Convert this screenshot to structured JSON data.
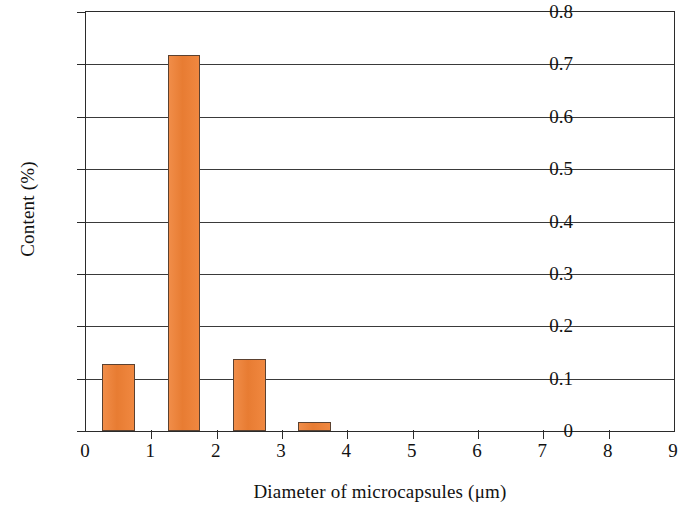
{
  "chart_data": {
    "type": "bar",
    "title": "",
    "xlabel": "Diameter of microcapsules (μm)",
    "ylabel": "Content (%)",
    "xlim": [
      0,
      9
    ],
    "ylim": [
      0,
      0.8
    ],
    "grid": true,
    "legend": null,
    "bar_width": 0.5,
    "x_tick_labels": [
      "0",
      "1",
      "2",
      "3",
      "4",
      "5",
      "6",
      "7",
      "8",
      "9"
    ],
    "x_ticks": [
      0,
      1,
      2,
      3,
      4,
      5,
      6,
      7,
      8,
      9
    ],
    "y_tick_labels": [
      "0",
      "0.1",
      "0.2",
      "0.3",
      "0.4",
      "0.5",
      "0.6",
      "0.7",
      "0.8"
    ],
    "y_ticks": [
      0,
      0.1,
      0.2,
      0.3,
      0.4,
      0.5,
      0.6,
      0.7,
      0.8
    ],
    "categories": [
      "0.5",
      "1.5",
      "2.5",
      "3.5"
    ],
    "x": [
      0.5,
      1.5,
      2.5,
      3.5
    ],
    "values": [
      0.128,
      0.718,
      0.137,
      0.017
    ],
    "colors": {
      "bar_fill": "#ef8034",
      "bar_edge": "#5b4130",
      "axis": "#2b2b2b",
      "grid": "#3a3a3a",
      "text": "#121212",
      "background": "#ffffff"
    }
  }
}
